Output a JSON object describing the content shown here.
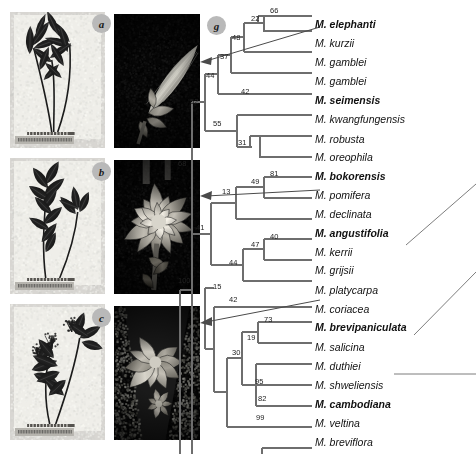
{
  "figure": {
    "type": "phylogenetic-cladogram-with-photo-plates",
    "panel_labels": [
      {
        "id": "a",
        "label": "a"
      },
      {
        "id": "b",
        "label": "b"
      },
      {
        "id": "c",
        "label": "c"
      },
      {
        "id": "g",
        "label": "g"
      }
    ]
  },
  "tree": {
    "outgroup": "Phoebe lanceolata",
    "tips": [
      {
        "name": "M. elephanti",
        "bold": true,
        "x": 316,
        "y": 16
      },
      {
        "name": "M. kurzii",
        "bold": false,
        "x": 316,
        "y": 37
      },
      {
        "name": "M. gamblei",
        "bold": false,
        "x": 316,
        "y": 58
      },
      {
        "name": "M. gamblei",
        "bold": false,
        "x": 316,
        "y": 79
      },
      {
        "name": "M. seimensis",
        "bold": true,
        "x": 316,
        "y": 100
      },
      {
        "name": "M. kwangfungensis",
        "bold": false,
        "x": 316,
        "y": 121
      },
      {
        "name": "M. robusta",
        "bold": false,
        "x": 316,
        "y": 142
      },
      {
        "name": "M. oreophila",
        "bold": false,
        "x": 316,
        "y": 162
      },
      {
        "name": "M. bokorensis",
        "bold": true,
        "x": 316,
        "y": 183
      },
      {
        "name": "M. pomifera",
        "bold": false,
        "x": 316,
        "y": 204
      },
      {
        "name": "M. declinata",
        "bold": false,
        "x": 316,
        "y": 225
      },
      {
        "name": "M. angustifolia",
        "bold": true,
        "x": 316,
        "y": 245
      },
      {
        "name": "M. kerrii",
        "bold": false,
        "x": 316,
        "y": 266
      },
      {
        "name": "M. grijsii",
        "bold": false,
        "x": 316,
        "y": 287
      },
      {
        "name": "M. platycarpa",
        "bold": false,
        "x": 316,
        "y": 307
      },
      {
        "name": "M. coriacea",
        "bold": false,
        "x": 316,
        "y": 328
      },
      {
        "name": "M. brevipaniculata",
        "bold": true,
        "x": 316,
        "y": 349
      },
      {
        "name": "M. salicina",
        "bold": false,
        "x": 316,
        "y": 370
      },
      {
        "name": "M. duthiei",
        "bold": false,
        "x": 316,
        "y": 391
      },
      {
        "name": "M. shweliensis",
        "bold": false,
        "x": 316,
        "y": 412
      },
      {
        "name": "M. cambodiana",
        "bold": true,
        "x": 316,
        "y": 433
      },
      {
        "name": "M. veltina",
        "bold": false,
        "x": 316,
        "y": 454
      },
      {
        "name": "M. breviflora",
        "bold": false,
        "x": 316,
        "y": 475
      },
      {
        "name": "Phoebe lanceolata",
        "bold": false,
        "x": 316,
        "y": 496
      }
    ],
    "bootstrap_values": [
      {
        "value": "66",
        "x": 270,
        "y": 7
      },
      {
        "value": "22",
        "x": 251,
        "y": 15
      },
      {
        "value": "48",
        "x": 232,
        "y": 34
      },
      {
        "value": "37",
        "x": 220,
        "y": 53
      },
      {
        "value": "44",
        "x": 206,
        "y": 72
      },
      {
        "value": "42",
        "x": 241,
        "y": 88
      },
      {
        "value": "52",
        "x": 190,
        "y": 98
      },
      {
        "value": "55",
        "x": 213,
        "y": 120
      },
      {
        "value": "31",
        "x": 238,
        "y": 139
      },
      {
        "value": "81",
        "x": 270,
        "y": 170
      },
      {
        "value": "49",
        "x": 251,
        "y": 178
      },
      {
        "value": "13",
        "x": 222,
        "y": 188
      },
      {
        "value": "68",
        "x": 178,
        "y": 160
      },
      {
        "value": "40",
        "x": 270,
        "y": 233
      },
      {
        "value": "47",
        "x": 251,
        "y": 241
      },
      {
        "value": "44",
        "x": 229,
        "y": 259
      },
      {
        "value": "41",
        "x": 196,
        "y": 224
      },
      {
        "value": "15",
        "x": 213,
        "y": 283
      },
      {
        "value": "42",
        "x": 229,
        "y": 296
      },
      {
        "value": "73",
        "x": 264,
        "y": 316
      },
      {
        "value": "19",
        "x": 247,
        "y": 334
      },
      {
        "value": "30",
        "x": 232,
        "y": 349
      },
      {
        "value": "95",
        "x": 255,
        "y": 378
      },
      {
        "value": "82",
        "x": 258,
        "y": 395
      },
      {
        "value": "99",
        "x": 256,
        "y": 414
      },
      {
        "value": "100",
        "x": 178,
        "y": 277
      }
    ]
  }
}
